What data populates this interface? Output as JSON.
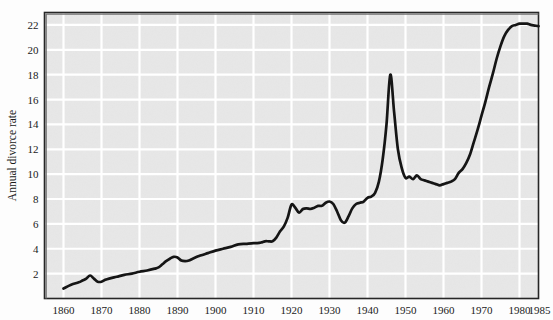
{
  "figure": {
    "background_color": "#fdfdfd",
    "plot_background_color": "#e7e7e7",
    "grid_color": "#ffffff",
    "line_color": "#151515",
    "axis_color": "#262626"
  },
  "chart_data": {
    "type": "line",
    "title": "",
    "subtitle": "",
    "xlabel": "",
    "ylabel": "Annual divorce rate",
    "xlim": [
      1855,
      1985
    ],
    "ylim": [
      0,
      23
    ],
    "grid": true,
    "legend": null,
    "legend_position": "none",
    "xticks": [
      1860,
      1870,
      1880,
      1890,
      1900,
      1910,
      1920,
      1930,
      1940,
      1950,
      1960,
      1970,
      1980,
      1985
    ],
    "xtick_labels": [
      "1860",
      "1870",
      "1880",
      "1890",
      "1900",
      "1910",
      "1920",
      "1930",
      "1940",
      "1950",
      "1960",
      "1970",
      "1980",
      "1985"
    ],
    "yticks": [
      2,
      4,
      6,
      8,
      10,
      12,
      14,
      16,
      18,
      20,
      22
    ],
    "ytick_labels": [
      "2",
      "4",
      "6",
      "8",
      "10",
      "12",
      "14",
      "16",
      "18",
      "20",
      "22"
    ],
    "series": [
      {
        "name": "Annual divorce rate",
        "x": [
          1860,
          1862,
          1864,
          1865,
          1866,
          1867,
          1868,
          1869,
          1870,
          1871,
          1872,
          1874,
          1876,
          1878,
          1880,
          1882,
          1884,
          1885,
          1886,
          1887,
          1888,
          1889,
          1890,
          1891,
          1892,
          1893,
          1894,
          1896,
          1898,
          1900,
          1902,
          1904,
          1906,
          1908,
          1910,
          1911,
          1912,
          1913,
          1914,
          1915,
          1916,
          1917,
          1918,
          1919,
          1920,
          1921,
          1922,
          1923,
          1924,
          1925,
          1926,
          1927,
          1928,
          1929,
          1930,
          1931,
          1932,
          1933,
          1934,
          1935,
          1936,
          1937,
          1938,
          1939,
          1940,
          1941,
          1942,
          1943,
          1944,
          1945,
          1946,
          1947,
          1948,
          1949,
          1950,
          1951,
          1952,
          1953,
          1954,
          1955,
          1956,
          1957,
          1958,
          1959,
          1960,
          1961,
          1962,
          1963,
          1964,
          1965,
          1966,
          1967,
          1968,
          1969,
          1970,
          1971,
          1972,
          1973,
          1974,
          1975,
          1976,
          1977,
          1978,
          1979,
          1980,
          1981,
          1982,
          1983,
          1984,
          1985
        ],
        "y": [
          0.8,
          1.1,
          1.3,
          1.45,
          1.6,
          1.85,
          1.6,
          1.35,
          1.35,
          1.5,
          1.6,
          1.75,
          1.9,
          2.0,
          2.15,
          2.25,
          2.4,
          2.5,
          2.75,
          3.0,
          3.2,
          3.35,
          3.3,
          3.05,
          3.0,
          3.05,
          3.2,
          3.45,
          3.65,
          3.85,
          4.0,
          4.15,
          4.35,
          4.4,
          4.45,
          4.45,
          4.5,
          4.6,
          4.6,
          4.6,
          4.9,
          5.4,
          5.8,
          6.5,
          7.55,
          7.3,
          6.9,
          7.2,
          7.25,
          7.2,
          7.3,
          7.45,
          7.45,
          7.7,
          7.8,
          7.6,
          7.0,
          6.3,
          6.1,
          6.6,
          7.25,
          7.6,
          7.7,
          7.8,
          8.1,
          8.2,
          8.5,
          9.4,
          11.2,
          14.0,
          18.0,
          15.0,
          12.0,
          10.5,
          9.7,
          9.8,
          9.6,
          9.9,
          9.6,
          9.5,
          9.4,
          9.3,
          9.2,
          9.1,
          9.2,
          9.3,
          9.4,
          9.6,
          10.1,
          10.4,
          10.9,
          11.6,
          12.6,
          13.6,
          14.7,
          15.8,
          17.0,
          18.1,
          19.3,
          20.3,
          21.1,
          21.6,
          21.9,
          22.0,
          22.1,
          22.1,
          22.1,
          22.0,
          21.95,
          21.9
        ]
      }
    ],
    "annotations": [],
    "notable_points": [
      {
        "label": "post-WWII peak",
        "x": 1946,
        "y": 18.0
      },
      {
        "label": "post-WWI peak",
        "x": 1920,
        "y": 7.55
      },
      {
        "label": "Depression trough",
        "x": 1933,
        "y": 6.1
      },
      {
        "label": "1950s-60s trough",
        "x": 1958,
        "y": 9.1
      },
      {
        "label": "modern plateau",
        "x": 1981,
        "y": 22.1
      },
      {
        "label": "series start",
        "x": 1860,
        "y": 0.8
      }
    ]
  }
}
